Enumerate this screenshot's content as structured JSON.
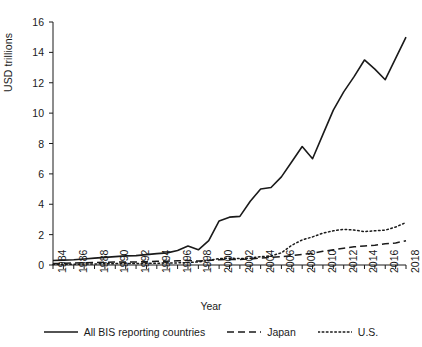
{
  "chart_data": {
    "type": "line",
    "title": "",
    "xlabel": "Year",
    "ylabel": "USD trillions",
    "xlim": [
      1984,
      2018
    ],
    "ylim": [
      0,
      16
    ],
    "yticks": [
      0,
      2,
      4,
      6,
      8,
      10,
      12,
      14,
      16
    ],
    "xticks": [
      1984,
      1986,
      1988,
      1990,
      1992,
      1994,
      1996,
      1998,
      2000,
      2002,
      2004,
      2006,
      2008,
      2010,
      2012,
      2014,
      2016,
      2018
    ],
    "xtick_labels": [
      "1984",
      "1986",
      "1988",
      "1990",
      "1992",
      "1994",
      "1996",
      "1998",
      "2000",
      "2002",
      "2004",
      "2006",
      "2008",
      "2010",
      "2012",
      "2014",
      "2016",
      "2018"
    ],
    "ytick_labels": [
      "0",
      "2",
      "4",
      "6",
      "8",
      "10",
      "12",
      "14",
      "16"
    ],
    "grid": false,
    "legend_position": "below",
    "x": [
      1984,
      1985,
      1986,
      1987,
      1988,
      1989,
      1990,
      1991,
      1992,
      1993,
      1994,
      1995,
      1996,
      1997,
      1998,
      1999,
      2000,
      2001,
      2002,
      2003,
      2004,
      2005,
      2006,
      2007,
      2008,
      2009,
      2010,
      2011,
      2012,
      2013,
      2014,
      2015,
      2016,
      2017,
      2018
    ],
    "series": [
      {
        "name": "All BIS reporting countries",
        "style": "solid",
        "color": "#1a1a1a",
        "values": [
          0.3,
          0.32,
          0.35,
          0.4,
          0.45,
          0.5,
          0.55,
          0.6,
          0.62,
          0.68,
          0.75,
          0.8,
          0.95,
          1.25,
          1.0,
          1.6,
          2.9,
          3.15,
          3.2,
          4.2,
          5.0,
          5.1,
          5.8,
          6.8,
          7.8,
          7.0,
          8.6,
          10.2,
          11.4,
          12.4,
          13.5,
          12.9,
          12.2,
          13.6,
          15.0
        ]
      },
      {
        "name": "Japan",
        "style": "dashed",
        "color": "#1a1a1a",
        "values": [
          0.1,
          0.11,
          0.13,
          0.15,
          0.17,
          0.18,
          0.2,
          0.2,
          0.2,
          0.22,
          0.24,
          0.25,
          0.28,
          0.3,
          0.26,
          0.3,
          0.35,
          0.37,
          0.36,
          0.4,
          0.45,
          0.5,
          0.55,
          0.62,
          0.7,
          0.78,
          0.9,
          1.0,
          1.1,
          1.2,
          1.25,
          1.3,
          1.4,
          1.45,
          1.6
        ]
      },
      {
        "name": "U.S.",
        "style": "dotted",
        "color": "#1a1a1a",
        "values": [
          0.04,
          0.05,
          0.05,
          0.06,
          0.07,
          0.08,
          0.09,
          0.1,
          0.1,
          0.11,
          0.12,
          0.13,
          0.14,
          0.16,
          0.2,
          0.3,
          0.42,
          0.45,
          0.42,
          0.45,
          0.55,
          0.6,
          0.8,
          1.3,
          1.65,
          1.85,
          2.1,
          2.25,
          2.35,
          2.3,
          2.2,
          2.25,
          2.3,
          2.5,
          2.8
        ]
      }
    ]
  }
}
